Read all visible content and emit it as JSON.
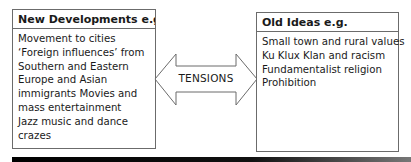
{
  "left_box": {
    "title": "New Developments e.g.",
    "lines": [
      "Movement to cities",
      "‘Foreign influences’ from",
      "Southern and Eastern",
      "Europe and Asian",
      "immigrants Movies and",
      "mass entertainment",
      "Jazz music and dance",
      "crazes"
    ]
  },
  "connector": {
    "label": "TENSIONS",
    "icon": "double-headed-arrow"
  },
  "right_box": {
    "title": "Old Ideas e.g.",
    "lines": [
      "Small town and rural values",
      "Ku Klux Klan and racism",
      "Fundamentalist religion",
      "Prohibition"
    ]
  },
  "colors": {
    "border": "#6b6b6b",
    "text": "#1a1a1a",
    "bottom_bar": "#000000"
  }
}
